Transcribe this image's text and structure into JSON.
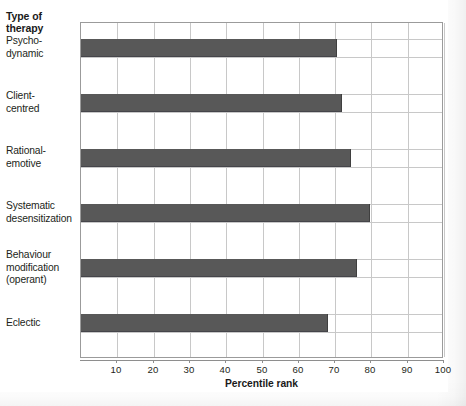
{
  "chart": {
    "type": "bar",
    "orientation": "horizontal",
    "category_axis_title": "Type of\ntherapy",
    "category_axis_title_line1": "Type of",
    "category_axis_title_line2": "therapy",
    "xlabel": "Percentile rank",
    "ylabel": "Type of therapy",
    "title": "",
    "bar_color": "#585858",
    "grid": "both",
    "xlim": [
      0,
      100
    ],
    "xticks": [
      10,
      20,
      30,
      40,
      50,
      60,
      70,
      80,
      90,
      100
    ]
  },
  "chart_data": {
    "type": "bar",
    "title": "",
    "xlabel": "Percentile rank",
    "ylabel": "Type of therapy",
    "xlim": [
      0,
      100
    ],
    "xticks": [
      10,
      20,
      30,
      40,
      50,
      60,
      70,
      80,
      90,
      100
    ],
    "grid": true,
    "legend": "none",
    "orientation": "horizontal",
    "categories": [
      "Psycho-dynamic",
      "Client-centred",
      "Rational-emotive",
      "Systematic desensitization",
      "Behaviour modification (operant)",
      "Eclectic"
    ],
    "values": [
      70.5,
      72,
      74.5,
      79.5,
      76,
      68
    ]
  },
  "categories": [
    {
      "lines": [
        "Psycho-",
        "dynamic"
      ],
      "value": 70.5
    },
    {
      "lines": [
        "Client-",
        "centred"
      ],
      "value": 72
    },
    {
      "lines": [
        "Rational-",
        "emotive"
      ],
      "value": 74.5
    },
    {
      "lines": [
        "Systematic",
        "desensitization"
      ],
      "value": 79.5
    },
    {
      "lines": [
        "Behaviour",
        "modification",
        "(operant)"
      ],
      "value": 76
    },
    {
      "lines": [
        "Eclectic"
      ],
      "value": 68
    }
  ],
  "ticks": [
    {
      "label": "10",
      "value": 10
    },
    {
      "label": "20",
      "value": 20
    },
    {
      "label": "30",
      "value": 30
    },
    {
      "label": "40",
      "value": 40
    },
    {
      "label": "50",
      "value": 50
    },
    {
      "label": "60",
      "value": 60
    },
    {
      "label": "70",
      "value": 70
    },
    {
      "label": "80",
      "value": 80
    },
    {
      "label": "90",
      "value": 90
    },
    {
      "label": "100",
      "value": 100
    }
  ]
}
